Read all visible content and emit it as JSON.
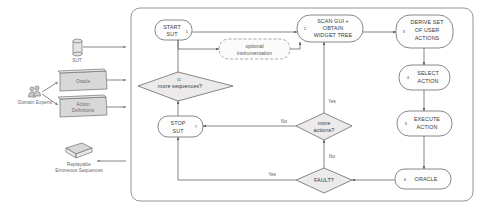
{
  "diagram": {
    "outer_container_label": "",
    "colors": {
      "node_fill": "#fdfdfd",
      "node_stroke": "#6a6a6a",
      "diamond_fill": "#eceaea",
      "line": "#5d5d5d",
      "artifact_fill": "#d8d8d8",
      "text": "#3a3a3a"
    },
    "nodes": [
      {
        "id": "start",
        "num": "1",
        "lines": [
          "START",
          "SUT"
        ]
      },
      {
        "id": "scan",
        "num": "2",
        "lines": [
          "SCAN GUI +",
          "OBTAIN",
          "WIDGET TREE"
        ]
      },
      {
        "id": "derive",
        "num": "3",
        "lines": [
          "DERIVE SET",
          "OF USER",
          "ACTIONS"
        ]
      },
      {
        "id": "select",
        "num": "4",
        "lines": [
          "SELECT",
          "ACTION"
        ]
      },
      {
        "id": "execute",
        "num": "5",
        "lines": [
          "EXECUTE",
          "ACTION"
        ]
      },
      {
        "id": "oracle",
        "num": "6",
        "lines": [
          "ORACLE"
        ]
      },
      {
        "id": "stop",
        "num": "7",
        "lines": [
          "STOP",
          "SUT"
        ]
      }
    ],
    "decisions": [
      {
        "id": "more_actions",
        "num": "",
        "lines": [
          "more",
          "actions?"
        ]
      },
      {
        "id": "fault",
        "num": "",
        "lines": [
          "FAULT?"
        ]
      },
      {
        "id": "more_sequences",
        "num": "11",
        "lines": [
          "more sequences?"
        ]
      }
    ],
    "optional_box": {
      "lines": [
        "optional",
        "instrumentation"
      ]
    },
    "edge_labels": {
      "more_actions_yes": "Yes",
      "more_actions_no": "No",
      "fault_yes": "Yes",
      "fault_no": "No"
    },
    "artifacts": [
      {
        "id": "sut",
        "label": "SUT",
        "shape": "cylinder"
      },
      {
        "id": "oracle_doc",
        "label": "Oracle",
        "shape": "box3d"
      },
      {
        "id": "actiondefs",
        "label": "Action\nDefinitions",
        "shape": "box3d",
        "label_line1": "Action",
        "label_line2": "Definitions"
      },
      {
        "id": "replayable",
        "label_line1": "Replayable",
        "label_line2": "Erroneous Sequences",
        "shape": "box3d-flat"
      },
      {
        "id": "domain_experts",
        "label": "Domain Experts",
        "shape": "people"
      }
    ]
  }
}
